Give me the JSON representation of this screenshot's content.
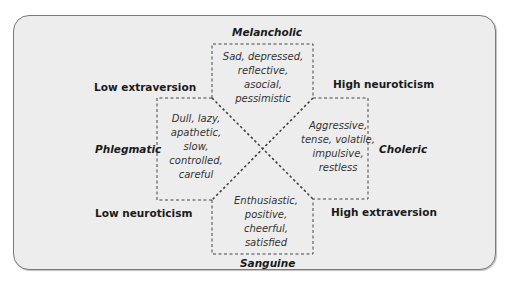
{
  "diagram": {
    "type": "four-temperaments-personality-diagram",
    "temperaments": {
      "melancholic": {
        "name": "Melancholic",
        "traits": [
          "Sad, depressed,",
          "reflective,",
          "asocial,",
          "pessimistic"
        ]
      },
      "phlegmatic": {
        "name": "Phlegmatic",
        "traits": [
          "Dull, lazy,",
          "apathetic,",
          "slow,",
          "controlled,",
          "careful"
        ]
      },
      "choleric": {
        "name": "Choleric",
        "traits": [
          "Aggressive,",
          "tense, volatile,",
          "impulsive,",
          "restless"
        ]
      },
      "sanguine": {
        "name": "Sanguine",
        "traits": [
          "Enthusiastic,",
          "positive,",
          "cheerful,",
          "satisfied"
        ]
      }
    },
    "axes": {
      "top_left": "Low extraversion",
      "top_right": "High neuroticism",
      "bottom_left": "Low neuroticism",
      "bottom_right": "High extraversion"
    },
    "colors": {
      "panel_background": "#ededed",
      "panel_border": "#7a7a7a",
      "dashed_line": "#444444",
      "label_text": "#1a1a1a",
      "trait_text": "#333333"
    }
  }
}
